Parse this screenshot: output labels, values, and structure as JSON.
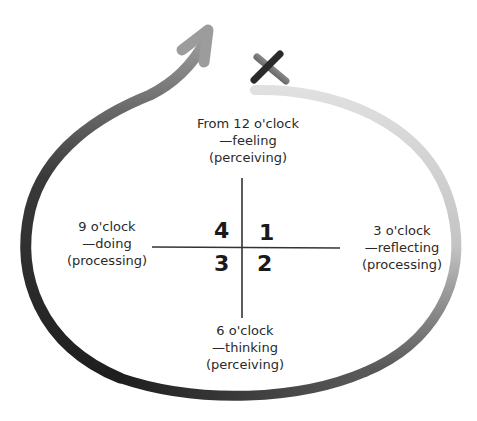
{
  "diagram": {
    "labels": {
      "top": {
        "line1": "From 12 o'clock",
        "line2": "—feeling",
        "line3": "(perceiving)"
      },
      "left": {
        "line1": "9 o'clock",
        "line2": "—doing",
        "line3": "(processing)"
      },
      "right": {
        "line1": "3 o'clock",
        "line2": "—reflecting",
        "line3": "(processing)"
      },
      "bottom": {
        "line1": "6 o'clock",
        "line2": "—thinking",
        "line3": "(perceiving)"
      }
    },
    "quadrants": {
      "q1": "1",
      "q2": "2",
      "q3": "3",
      "q4": "4"
    },
    "start_marker": "X",
    "colors": {
      "stroke_dark": "#1e1e1e",
      "stroke_light": "#d0d0d0",
      "axis": "#333333"
    }
  }
}
